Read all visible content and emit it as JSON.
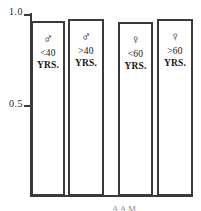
{
  "chart_data": {
    "type": "bar",
    "title": "",
    "xlabel": "",
    "ylabel": "",
    "ylim": [
      0.0,
      1.0
    ],
    "y_ticks": [
      "0.5",
      "1.0"
    ],
    "y_tick_values": [
      0.5,
      1.0
    ],
    "grid": false,
    "legend": "none",
    "categories": [
      "<40 YRS.",
      ">40 YRS.",
      "<60 YRS.",
      ">60 YRS."
    ],
    "group_labels": [
      "male",
      "male",
      "female",
      "female"
    ],
    "values": [
      0.96,
      0.975,
      0.955,
      0.975
    ],
    "bars": [
      {
        "symbol": "♂",
        "symbol_name": "male-symbol",
        "age": "<40",
        "unit": "YRS.",
        "value": 0.96
      },
      {
        "symbol": "♂",
        "symbol_name": "male-symbol",
        "age": ">40",
        "unit": "YRS.",
        "value": 0.975
      },
      {
        "symbol": "♀",
        "symbol_name": "female-symbol",
        "age": "<60",
        "unit": "YRS.",
        "value": 0.955
      },
      {
        "symbol": "♀",
        "symbol_name": "female-symbol",
        "age": ">60",
        "unit": "YRS.",
        "value": 0.975
      }
    ]
  },
  "axis": {
    "tick_top": "1.0",
    "tick_middle": "0.5"
  },
  "caption": {
    "clipped_text_left": "A A M",
    "clipped_text_right": "M  d"
  },
  "colors": {
    "line": "#3a3a3a",
    "text": "#151515",
    "background": "#ffffff"
  }
}
